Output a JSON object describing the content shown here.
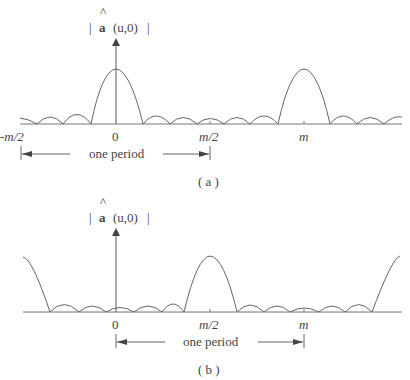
{
  "figure": {
    "panels": [
      {
        "id": "a",
        "caption": "( a )",
        "y_label": {
          "hat_symbol": "a",
          "argument": "(u,0)"
        },
        "x_ticks": [
          "-m/2",
          "0",
          "m/2",
          "m"
        ],
        "period_label": "one period",
        "period_span": [
          "-m/2",
          "m/2"
        ],
        "main_peaks_at": [
          "0",
          "m"
        ]
      },
      {
        "id": "b",
        "caption": "( b )",
        "y_label": {
          "hat_symbol": "a",
          "argument": "(u,0)"
        },
        "x_ticks": [
          "0",
          "m/2",
          "m"
        ],
        "period_label": "one period",
        "period_span": [
          "0",
          "m"
        ],
        "main_peaks_at": [
          "m/2",
          "edges (-m/2, 3m/2)"
        ]
      }
    ]
  },
  "labels": {
    "a": {
      "bar_left": "|",
      "hat": "a",
      "arg": "(u,0)",
      "bar_right": "|",
      "tick_neg_half": "-m/2",
      "tick_zero": "0",
      "tick_half": "m/2",
      "tick_m": "m",
      "period": "one period",
      "caption": "( a )"
    },
    "b": {
      "bar_left": "|",
      "hat": "a",
      "arg": "(u,0)",
      "bar_right": "|",
      "tick_zero": "0",
      "tick_half": "m/2",
      "tick_m": "m",
      "period": "one period",
      "caption": "( b )"
    }
  },
  "colors": {
    "line": "#555555",
    "axis": "#777777",
    "text": "#444444"
  }
}
